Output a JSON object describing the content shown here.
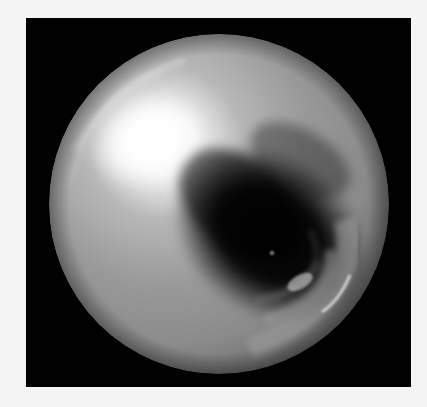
{
  "image": {
    "subject": "chrome-sphere",
    "colors": {
      "page_background": "#f4f4f4",
      "frame_background": "#000000",
      "sphere_base": "#8e8e8e",
      "highlight": "#ffffff",
      "shadow": "#050505"
    },
    "frame": {
      "x": 26,
      "y": 18,
      "width": 385,
      "height": 369
    },
    "sphere": {
      "cx": 219,
      "cy": 204,
      "r": 170
    },
    "highlight": {
      "cx": 145,
      "cy": 140
    },
    "reflection_dot": {
      "cx": 272,
      "cy": 253
    }
  }
}
